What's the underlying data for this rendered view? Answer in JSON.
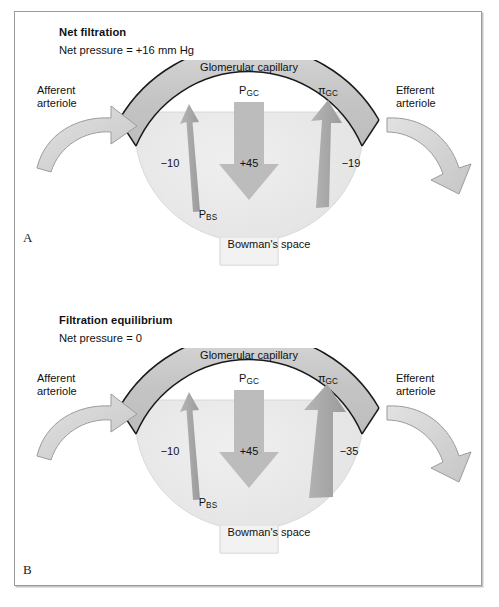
{
  "figure": {
    "background_color": "#ffffff",
    "border_color": "#9a9a9a",
    "capillary_fill": "#c9c9c9",
    "capsule_fill": "#e8e8e8",
    "arrow_gray": "#a8a8a8",
    "arrow_dark_gray": "#8f8f8f",
    "outline_color": "#1a1a1a"
  },
  "panels": [
    {
      "letter": "A",
      "title": "Net filtration",
      "subtitle": "Net pressure = +16 mm Hg",
      "labels": {
        "afferent_line1": "Afferent",
        "afferent_line2": "arteriole",
        "efferent_line1": "Efferent",
        "efferent_line2": "arteriole",
        "capillary": "Glomerular capillary",
        "bowmans_space": "Bowman's space",
        "p_gc_base": "P",
        "p_gc_sub": "GC",
        "pi_gc_base": "π",
        "pi_gc_sub": "GC",
        "p_bs_base": "P",
        "p_bs_sub": "BS"
      },
      "values": {
        "p_bs": "−10",
        "p_gc": "+45",
        "pi_gc": "−19"
      },
      "arrow_widths": {
        "p_bs": 7,
        "p_gc": 30,
        "pi_gc": 13
      }
    },
    {
      "letter": "B",
      "title": "Filtration equilibrium",
      "subtitle": "Net pressure = 0",
      "labels": {
        "afferent_line1": "Afferent",
        "afferent_line2": "arteriole",
        "efferent_line1": "Efferent",
        "efferent_line2": "arteriole",
        "capillary": "Glomerular capillary",
        "bowmans_space": "Bowman's space",
        "p_gc_base": "P",
        "p_gc_sub": "GC",
        "pi_gc_base": "π",
        "pi_gc_sub": "GC",
        "p_bs_base": "P",
        "p_bs_sub": "BS"
      },
      "values": {
        "p_bs": "−10",
        "p_gc": "+45",
        "pi_gc": "−35"
      },
      "arrow_widths": {
        "p_bs": 7,
        "p_gc": 30,
        "pi_gc": 24
      }
    }
  ]
}
